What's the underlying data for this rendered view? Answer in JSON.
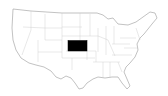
{
  "map": {
    "region": "United States",
    "highlighted_state": "Kansas",
    "highlight_color": "#000000",
    "base_color": "#ffffff",
    "border_color": "#bbbbbb"
  }
}
